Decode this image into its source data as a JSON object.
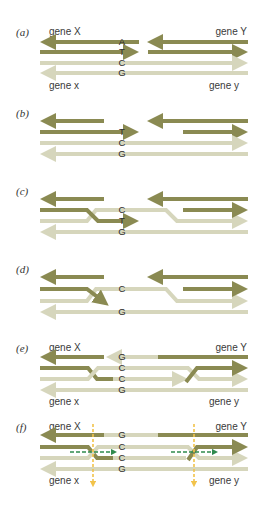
{
  "colors": {
    "dark_strand": "#8a8a52",
    "light_strand": "#d6d6bc",
    "yellow_arrow": "#f2c34a",
    "green_arrow": "#2f8a4e",
    "text": "#333333"
  },
  "panels": [
    {
      "id": "a",
      "label": "(a)",
      "top_left": "gene X",
      "top_right": "gene Y",
      "bottom_left": "gene x",
      "bottom_right": "gene y",
      "bases": [
        "A",
        "T",
        "C",
        "G"
      ]
    },
    {
      "id": "b",
      "label": "(b)",
      "bases": [
        "T",
        "C",
        "G"
      ]
    },
    {
      "id": "c",
      "label": "(c)",
      "bases": [
        "C",
        "T",
        "G"
      ]
    },
    {
      "id": "d",
      "label": "(d)",
      "bases": [
        "C",
        "G"
      ]
    },
    {
      "id": "e",
      "label": "(e)",
      "top_left": "gene X",
      "top_right": "gene Y",
      "bottom_left": "gene x",
      "bottom_right": "gene y",
      "bases": [
        "G",
        "C",
        "C",
        "G"
      ]
    },
    {
      "id": "f",
      "label": "(f)",
      "top_left": "gene X",
      "top_right": "gene Y",
      "bottom_left": "gene x",
      "bottom_right": "gene y",
      "bases": [
        "G",
        "C",
        "C",
        "G"
      ]
    }
  ]
}
